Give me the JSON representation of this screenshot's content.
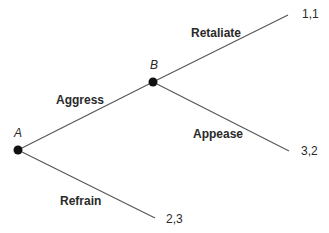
{
  "tree": {
    "nodes": [
      {
        "id": "A",
        "label": "A"
      },
      {
        "id": "B",
        "label": "B"
      }
    ],
    "branches": [
      {
        "from": "A",
        "to": "B",
        "label": "Aggress"
      },
      {
        "from": "A",
        "to": "leaf3",
        "label": "Refrain"
      },
      {
        "from": "B",
        "to": "leaf1",
        "label": "Retaliate"
      },
      {
        "from": "B",
        "to": "leaf2",
        "label": "Appease"
      }
    ],
    "payoffs": {
      "retaliate": "1,1",
      "appease": "3,2",
      "refrain": "2,3"
    }
  },
  "colors": {
    "line": "#555555",
    "node": "#111111",
    "text": "#2a2a2a"
  }
}
